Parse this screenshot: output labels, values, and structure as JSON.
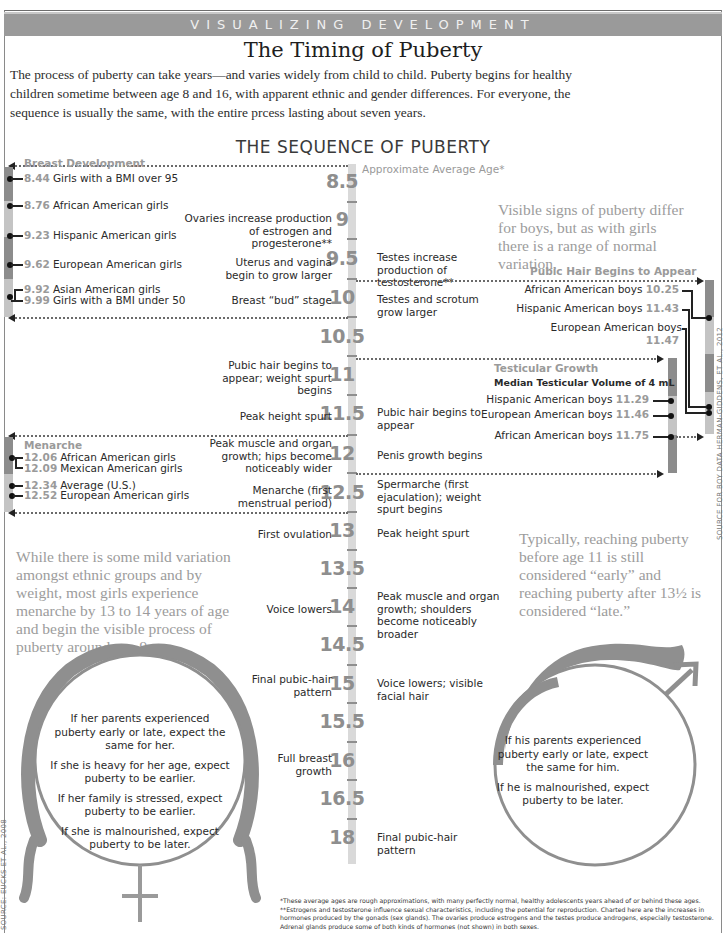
{
  "header": {
    "banner": "VISUALIZING DEVELOPMENT",
    "title": "The Timing of Puberty",
    "intro": "The process of puberty can take years—and varies widely from child to child. Puberty begins for healthy children sometime between age 8 and 16, with apparent ethnic and gender differences. For everyone, the sequence is usually the same, with the entire prcess lasting about seven years."
  },
  "sequence": {
    "title": "THE SEQUENCE OF PUBERTY",
    "axis_label": "Approximate Average Age*",
    "ticks": [
      "8.5",
      "9",
      "9.5",
      "10",
      "10.5",
      "11",
      "11.5",
      "12",
      "12.5",
      "13",
      "13.5",
      "14",
      "14.5",
      "15",
      "15.5",
      "16",
      "16.5",
      "18"
    ],
    "girls_events": [
      {
        "age": "9",
        "text": "Ovaries increase production of estrogen and progesterone**"
      },
      {
        "age": "9.5",
        "text": "Uterus and vagina begin to grow larger"
      },
      {
        "age": "10",
        "text": "Breast “bud” stage"
      },
      {
        "age": "11",
        "text": "Pubic hair begins to appear; weight spurt begins"
      },
      {
        "age": "11.5",
        "text": "Peak height spurt"
      },
      {
        "age": "12",
        "text": "Peak muscle and organ growth; hips become noticeably wider"
      },
      {
        "age": "12.5",
        "text": "Menarche (first menstrual period)"
      },
      {
        "age": "13",
        "text": "First ovulation"
      },
      {
        "age": "14",
        "text": "Voice lowers"
      },
      {
        "age": "15",
        "text": "Final pubic-hair pattern"
      },
      {
        "age": "16",
        "text": "Full breast growth"
      }
    ],
    "boys_events": [
      {
        "age": "9.5",
        "text": "Testes increase production of testosterone**"
      },
      {
        "age": "10",
        "text": "Testes and scrotum grow larger"
      },
      {
        "age": "11.5",
        "text": "Pubic hair begins to appear"
      },
      {
        "age": "12",
        "text": "Penis growth begins"
      },
      {
        "age": "12.5",
        "text": "Spermarche (first ejaculation); weight spurt begins"
      },
      {
        "age": "13",
        "text": "Peak height spurt"
      },
      {
        "age": "14",
        "text": "Peak muscle and organ growth; shoulders become noticeably broader"
      },
      {
        "age": "15",
        "text": "Voice lowers; visible facial hair"
      },
      {
        "age": "18",
        "text": "Final pubic-hair pattern"
      }
    ]
  },
  "breast_development": {
    "label": "Breast Development",
    "rows": [
      {
        "value": "8.44",
        "group": "Girls with a BMI over 95"
      },
      {
        "value": "8.76",
        "group": "African American girls"
      },
      {
        "value": "9.23",
        "group": "Hispanic American girls"
      },
      {
        "value": "9.62",
        "group": "European American girls"
      },
      {
        "value": "9.92",
        "group": "Asian American girls"
      },
      {
        "value": "9.99",
        "group": "Girls with a BMI under 50"
      }
    ]
  },
  "menarche": {
    "label": "Menarche",
    "rows": [
      {
        "value": "12.06",
        "group": "African American girls"
      },
      {
        "value": "12.09",
        "group": "Mexican American girls"
      },
      {
        "value": "12.34",
        "group": "Average (U.S.)"
      },
      {
        "value": "12.52",
        "group": "European American girls"
      }
    ]
  },
  "pubic_hair_boys": {
    "label": "Pubic Hair Begins to Appear",
    "rows": [
      {
        "group": "African American boys",
        "value": "10.25"
      },
      {
        "group": "Hispanic American boys",
        "value": "11.43"
      },
      {
        "group": "European American boys",
        "value": "11.47"
      }
    ]
  },
  "testicular_growth": {
    "label": "Testicular Growth",
    "sublabel": "Median Testicular Volume of 4 mL",
    "rows": [
      {
        "group": "Hispanic American boys",
        "value": "11.29"
      },
      {
        "group": "European American boys",
        "value": "11.46"
      },
      {
        "group": "African American boys",
        "value": "11.75"
      }
    ]
  },
  "callouts": {
    "boys_variation": "Visible signs of puberty differ for boys, but as with girls there is a range of normal variation.",
    "girls_menarche": "While there is some mild variation amongst ethnic groups and by weight, most girls experience menarche by 13 to 14 years of age and begin the visible process of puberty around age 9.",
    "early_late": "Typically, reaching puberty before age 11 is still considered “early” and reaching puberty after 13½ is considered “late.”"
  },
  "female_symbol": {
    "lines": [
      "If her parents experienced puberty early or late, expect the same for her.",
      "If she is heavy for her age, expect puberty to be earlier.",
      "If her family is stressed, expect puberty to be earlier.",
      "If she is malnourished, expect puberty to be later."
    ]
  },
  "male_symbol": {
    "lines": [
      "If his parents experienced puberty early or late, expect the same for him.",
      "If he is malnourished, expect puberty to be later."
    ]
  },
  "footnotes": [
    "*These average ages are rough approximations, with many perfectly normal, healthy adolescents years ahead of or behind these ages.",
    "**Estrogens and testosterone influence sexual characteristics, including the potential for reproduction. Charted here are the increases in hormones produced by the gonads (sex glands). The ovaries produce estrogens and the testes produce androgens, especially testosterone. Adrenal glands produce some of both kinds of hormones (not shown) in both sexes."
  ],
  "sources": {
    "girls": "SOURCE: EUCKS ET AL., 2008",
    "boys": "SOURCE FOR BOY DATA HERMAN-GIDDENS, ET AL., 2012"
  },
  "colors": {
    "banner": "#9a9a9a",
    "bar_dark": "#8c8c8c",
    "bar_light": "#c4c4c4",
    "symbol": "#8f8f8f",
    "callout_text": "#9c9c9c"
  }
}
